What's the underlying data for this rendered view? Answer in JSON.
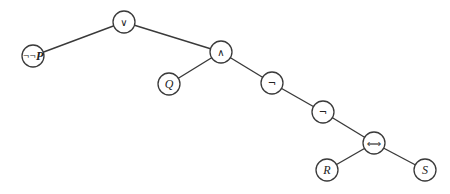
{
  "diagram": {
    "type": "syntax-tree",
    "node_radius": 11,
    "stroke_color": "#3a3a3a",
    "fill_color": "#ffffff",
    "nodes": [
      {
        "id": "n0",
        "label": "∨",
        "kind": "op",
        "x": 124,
        "y": 22
      },
      {
        "id": "n1",
        "label": "¬¬P",
        "kind": "mixed",
        "x": 33,
        "y": 56
      },
      {
        "id": "n2",
        "label": "∧",
        "kind": "op",
        "x": 221,
        "y": 52
      },
      {
        "id": "n3",
        "label": "Q",
        "kind": "atom",
        "x": 169,
        "y": 84
      },
      {
        "id": "n4",
        "label": "¬",
        "kind": "op",
        "x": 272,
        "y": 83
      },
      {
        "id": "n5",
        "label": "¬",
        "kind": "op",
        "x": 323,
        "y": 112
      },
      {
        "id": "n6",
        "label": "⟺",
        "kind": "op",
        "x": 374,
        "y": 143
      },
      {
        "id": "n7",
        "label": "R",
        "kind": "atom",
        "x": 327,
        "y": 170
      },
      {
        "id": "n8",
        "label": "S",
        "kind": "atom",
        "x": 425,
        "y": 170
      }
    ],
    "edges": [
      {
        "from": "n0",
        "to": "n1"
      },
      {
        "from": "n0",
        "to": "n2"
      },
      {
        "from": "n2",
        "to": "n3"
      },
      {
        "from": "n2",
        "to": "n4"
      },
      {
        "from": "n4",
        "to": "n5"
      },
      {
        "from": "n5",
        "to": "n6"
      },
      {
        "from": "n6",
        "to": "n7"
      },
      {
        "from": "n6",
        "to": "n8"
      }
    ]
  }
}
